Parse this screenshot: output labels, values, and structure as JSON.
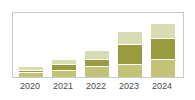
{
  "chart_data": {
    "type": "bar",
    "subtype": "stacked-bar",
    "title": "",
    "subtitle": "",
    "xlabel": "",
    "ylabel": "",
    "categories": [
      "2020",
      "2021",
      "2022",
      "2023",
      "2024"
    ],
    "ylim": [
      0,
      60
    ],
    "grid": false,
    "legend": "none",
    "axis_frame": true,
    "series": [
      {
        "name": "Segment 3 (top)",
        "color": "#d9dcb2",
        "values": [
          3,
          5,
          8,
          12,
          14
        ]
      },
      {
        "name": "Segment 2 (middle)",
        "color": "#9a9b3f",
        "values": [
          2,
          5,
          7,
          19,
          20
        ]
      },
      {
        "name": "Segment 1 (bottom)",
        "color": "#c4c277",
        "values": [
          4,
          6,
          9,
          11,
          16
        ]
      }
    ],
    "totals": [
      9,
      16,
      24,
      42,
      50
    ]
  },
  "axis": {
    "tick_labels": [
      "2020",
      "2021",
      "2022",
      "2023",
      "2024"
    ]
  },
  "style": {
    "frame_color": "#c9c9c9",
    "background": "#ffffff",
    "tick_label_color": "#4a4a4a",
    "separator_color": "#ffffff"
  }
}
